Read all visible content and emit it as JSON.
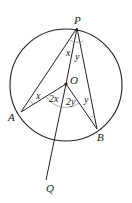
{
  "diagram": {
    "type": "circle-geometry",
    "points": {
      "P": {
        "label": "P",
        "x": 77,
        "y": 28
      },
      "O": {
        "label": "O",
        "x": 66,
        "y": 84
      },
      "A": {
        "label": "A",
        "x": 21,
        "y": 112
      },
      "B": {
        "label": "B",
        "x": 97,
        "y": 129
      },
      "Q": {
        "label": "Q",
        "x": 46,
        "y": 180
      }
    },
    "circle": {
      "cx": 66,
      "cy": 85,
      "r": 56
    },
    "angles": {
      "APO": "x",
      "OPB": "y",
      "PAO": "x",
      "PBO": "y",
      "AOQ": "2x",
      "QOB": "2y"
    },
    "stroke_color": "#222222"
  }
}
